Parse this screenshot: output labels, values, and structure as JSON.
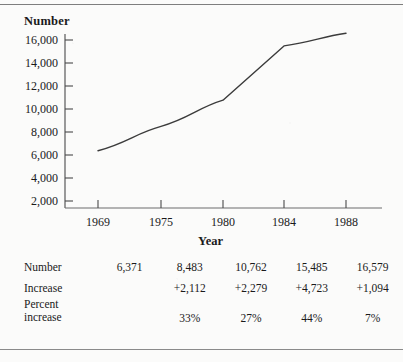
{
  "chart_data": {
    "type": "line",
    "title": "",
    "xlabel": "Year",
    "ylabel": "Number",
    "x": [
      1969,
      1975,
      1980,
      1984,
      1988
    ],
    "categories": [
      "1969",
      "1975",
      "1980",
      "1984",
      "1988"
    ],
    "values": [
      6371,
      8483,
      10762,
      15485,
      16579
    ],
    "series": [
      {
        "name": "Number",
        "values": [
          6371,
          8483,
          10762,
          15485,
          16579
        ]
      }
    ],
    "ylim": [
      0,
      17000
    ],
    "yticks": [
      2000,
      4000,
      6000,
      8000,
      10000,
      12000,
      14000,
      16000
    ],
    "ytick_labels": [
      "2,000",
      "4,000",
      "6,000",
      "8,000",
      "10,000",
      "12,000",
      "14,000",
      "16,000"
    ],
    "xtick_labels": [
      "1969",
      "1975",
      "1980",
      "1984",
      "1988"
    ],
    "grid": false,
    "legend": "none",
    "line_color": "#3b3b3b"
  },
  "axes": {
    "y_title": "Number",
    "x_title": "Year",
    "y_labels": [
      "16,000",
      "14,000",
      "12,000",
      "10,000",
      "8,000",
      "6,000",
      "4,000",
      "2,000"
    ],
    "x_labels": [
      "1969",
      "1975",
      "1980",
      "1984",
      "1988"
    ]
  },
  "table": {
    "rows": [
      {
        "label": "Number",
        "label_line2": "",
        "values": [
          "6,371",
          "8,483",
          "10,762",
          "15,485",
          "16,579"
        ]
      },
      {
        "label": "Increase",
        "label_line2": "",
        "values": [
          "",
          "+2,112",
          "+2,279",
          "+4,723",
          "+1,094"
        ]
      },
      {
        "label": "Percent",
        "label_line2": "increase",
        "values": [
          "",
          "33%",
          "27%",
          "44%",
          "7%"
        ]
      }
    ]
  }
}
